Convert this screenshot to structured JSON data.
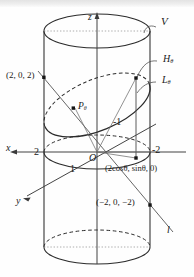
{
  "figure": {
    "axes": {
      "z_label": "z",
      "x_label": "x",
      "y_label": "y",
      "origin_label": "O"
    },
    "ticks": {
      "x_positive": "2",
      "x_negative": "-2",
      "y_positive": "1",
      "y_negative": "-1"
    },
    "labels": {
      "solid": "V",
      "curve_h": "H",
      "curve_h_sub": "θ",
      "curve_l": "L",
      "curve_l_sub": "θ",
      "point_p": "P",
      "point_p_sub": "θ",
      "line_l": "l",
      "point_top": "(2, 0, 2)",
      "point_bottom": "(−2, 0, −2)",
      "point_param": "(2cosθ, sinθ, 0)"
    },
    "colors": {
      "ink": "#1a1a1a",
      "stroke": "#2b2b2b",
      "thin": "#555555",
      "dotted": "#8d8d8d",
      "background": "#fefefe"
    }
  }
}
